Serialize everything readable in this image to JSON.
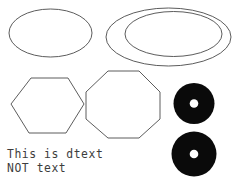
{
  "canvas": {
    "width": 235,
    "height": 181,
    "background_color": "#ffffff",
    "stroke_color": "#4a4a4a",
    "fill_color": "#0a0a0a",
    "hole_color": "#ffffff",
    "text_color": "#3d3d3d"
  },
  "text_entities": {
    "line1": "This is dtext",
    "line2": "NOT text"
  },
  "shapes": {
    "ellipse_left": {
      "label": "ellipse",
      "cx": 50.5,
      "cy": 33,
      "rx": 41.5,
      "ry": 24
    },
    "ellipse_outer_right": {
      "label": "ellipse-outer",
      "cx": 168.5,
      "cy": 37,
      "rx": 62.5,
      "ry": 29
    },
    "ellipse_inner_right": {
      "label": "ellipse-inner",
      "cx": 173.5,
      "cy": 34,
      "rx": 48.5,
      "ry": 22.5
    },
    "hexagon": {
      "label": "hexagon",
      "points": "11,104 31,78 68,78 84,104 66,133 29,133"
    },
    "octagon": {
      "label": "octagon",
      "points": "86,92 108,71 139,71 160,92 160,119 139,138 108,138 86,119"
    },
    "donut_top": {
      "label": "donut",
      "cx": 194,
      "cy": 103.5,
      "r_outer": 20.5,
      "r_hole": 4.3
    },
    "donut_bottom": {
      "label": "donut",
      "cx": 194,
      "cy": 154,
      "r_outer": 22.5,
      "r_hole": 4.3
    }
  }
}
